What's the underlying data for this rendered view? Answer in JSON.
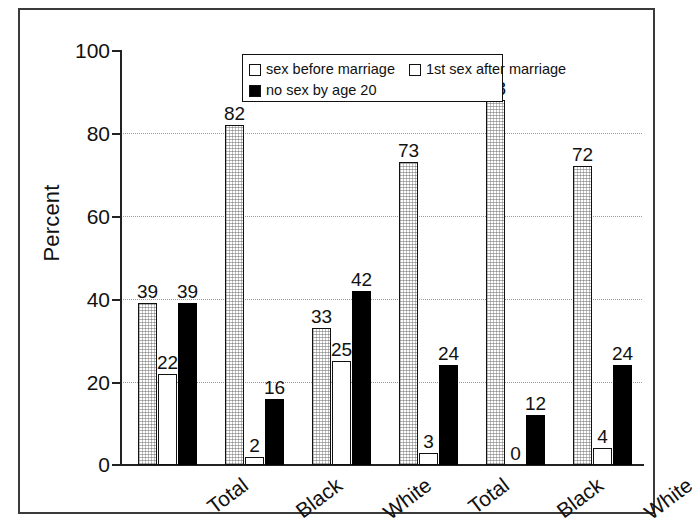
{
  "chart_data": {
    "type": "bar",
    "title": "",
    "xlabel": "",
    "ylabel": "Percent",
    "ylim": [
      0,
      100
    ],
    "yticks": [
      0,
      20,
      40,
      60,
      80,
      100
    ],
    "ytick_labels": [
      "0",
      "20",
      "40",
      "60",
      "80",
      "100"
    ],
    "grid": "horizontal dotted at 20, 40, 60, 80",
    "legend_position": "top-center inside plot",
    "categories": [
      "Total",
      "Black",
      "White",
      "Total",
      "Black",
      "White"
    ],
    "series": [
      {
        "name": "sex before marriage",
        "fill": "gray-stipple",
        "color": "#b8b8b8",
        "values": [
          39,
          82,
          33,
          73,
          88,
          72
        ],
        "labels": [
          "39",
          "82",
          "33",
          "73",
          "88",
          "72"
        ]
      },
      {
        "name": "1st sex after marriage",
        "fill": "white",
        "color": "#ffffff",
        "values": [
          22,
          2,
          25,
          3,
          0,
          4
        ],
        "labels": [
          "22",
          "2",
          "25",
          "3",
          "0",
          "4"
        ]
      },
      {
        "name": "no sex by age 20",
        "fill": "solid-black",
        "color": "#000000",
        "values": [
          39,
          16,
          42,
          24,
          12,
          24
        ],
        "labels": [
          "39",
          "16",
          "42",
          "24",
          "12",
          "24"
        ]
      }
    ]
  },
  "axis": {
    "y_title": "Percent",
    "y_ticks": [
      "100",
      "80",
      "60",
      "40",
      "20",
      "0"
    ]
  },
  "legend": {
    "items": [
      {
        "label": "sex before marriage",
        "swatch": "white-square"
      },
      {
        "label": "1st sex after marriage",
        "swatch": "white-square"
      },
      {
        "label": "no sex by age 20",
        "swatch": "black-square"
      }
    ]
  },
  "xcats": [
    "Total",
    "Black",
    "White",
    "Total",
    "Black",
    "White"
  ],
  "caption": {
    "text": ""
  }
}
